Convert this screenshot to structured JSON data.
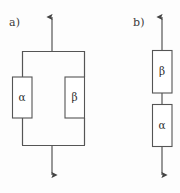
{
  "figure": {
    "type": "reliability-block-diagram",
    "background_color": "#fdfdfd",
    "stroke_color": "#555555",
    "text_color": "#2f2f2f",
    "width": 180,
    "height": 193,
    "panels": [
      {
        "key": "a",
        "label": "a)",
        "configuration": "parallel",
        "blocks": [
          {
            "key": "alpha_a",
            "label": "α",
            "icon_name": "alpha-symbol"
          },
          {
            "key": "beta_a",
            "label": "β",
            "icon_name": "beta-symbol"
          }
        ],
        "arrows": [
          {
            "key": "top",
            "direction": "up",
            "icon_name": "arrow-up-icon"
          },
          {
            "key": "bottom",
            "direction": "down",
            "icon_name": "arrow-down-icon"
          }
        ]
      },
      {
        "key": "b",
        "label": "b)",
        "configuration": "series",
        "blocks": [
          {
            "key": "beta_b",
            "label": "β",
            "icon_name": "beta-symbol"
          },
          {
            "key": "alpha_b",
            "label": "α",
            "icon_name": "alpha-symbol"
          }
        ],
        "arrows": [
          {
            "key": "top",
            "direction": "up",
            "icon_name": "arrow-up-icon"
          },
          {
            "key": "bottom",
            "direction": "down",
            "icon_name": "arrow-down-icon"
          }
        ]
      }
    ]
  }
}
